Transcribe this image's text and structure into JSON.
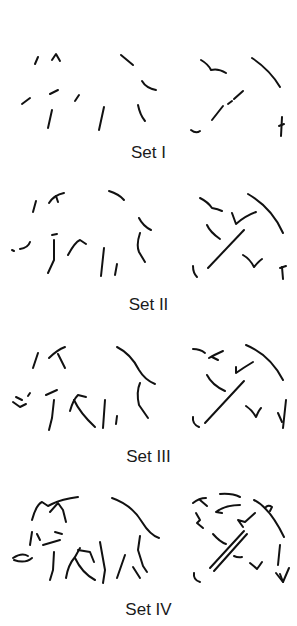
{
  "figure": {
    "subjects": [
      "elephant",
      "umbrella"
    ],
    "sets": [
      {
        "label": "Set I",
        "completeness": "least complete"
      },
      {
        "label": "Set II",
        "completeness": "more fragments"
      },
      {
        "label": "Set III",
        "completeness": "more fragments"
      },
      {
        "label": "Set IV",
        "completeness": "most complete"
      }
    ]
  }
}
